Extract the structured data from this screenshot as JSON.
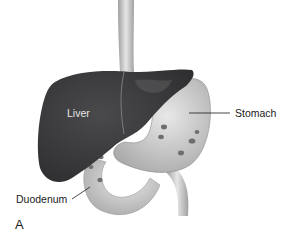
{
  "labels": {
    "liver": "Liver",
    "stomach": "Stomach",
    "duodenum": "Duodenum",
    "panel": "A"
  },
  "colors": {
    "liver": "#3a3a3c",
    "organ_light": "#d8d8d8",
    "esophagus": "#cfcfcf",
    "rugae": "#6a6a6a",
    "background": "#ffffff"
  }
}
